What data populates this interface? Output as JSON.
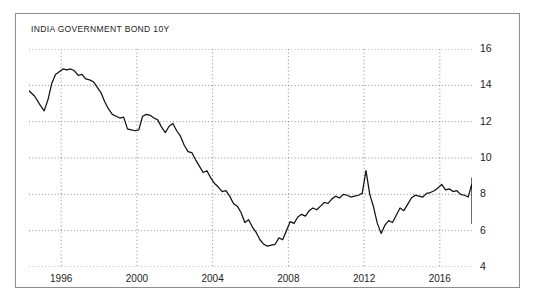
{
  "card": {
    "border_color": "#8d8d8d",
    "background": "#ffffff"
  },
  "chart_data": {
    "type": "line",
    "title": "INDIA GOVERNMENT BOND 10Y",
    "xlabel": "",
    "ylabel": "",
    "series_name": "India Government Bond 10Y Yield",
    "line_color": "#111111",
    "grid": true,
    "grid_style": "dotted",
    "grid_color": "#6b6b6b",
    "legend_position": "none",
    "xlim": [
      1994.3,
      2017.7
    ],
    "ylim": [
      4,
      16
    ],
    "yticks": [
      4,
      6,
      8,
      10,
      12,
      14,
      16
    ],
    "ytick_labels": [
      "4",
      "6",
      "8",
      "10",
      "12",
      "14",
      "16"
    ],
    "xticks": [
      1996,
      2000,
      2004,
      2008,
      2012,
      2016
    ],
    "xtick_labels": [
      "1996",
      "2000",
      "2004",
      "2008",
      "2012",
      "2016"
    ],
    "x": [
      1994.3,
      1994.6,
      1994.9,
      1995.1,
      1995.3,
      1995.5,
      1995.7,
      1995.9,
      1996.1,
      1996.3,
      1996.5,
      1996.7,
      1996.9,
      1997.1,
      1997.3,
      1997.5,
      1997.7,
      1997.9,
      1998.1,
      1998.3,
      1998.5,
      1998.7,
      1998.9,
      1999.1,
      1999.3,
      1999.5,
      1999.7,
      1999.9,
      2000.1,
      2000.3,
      2000.5,
      2000.7,
      2000.9,
      2001.1,
      2001.3,
      2001.5,
      2001.7,
      2001.9,
      2002.1,
      2002.3,
      2002.5,
      2002.7,
      2002.9,
      2003.1,
      2003.3,
      2003.5,
      2003.7,
      2003.9,
      2004.1,
      2004.3,
      2004.5,
      2004.7,
      2004.9,
      2005.1,
      2005.3,
      2005.5,
      2005.7,
      2005.9,
      2006.1,
      2006.3,
      2006.5,
      2006.7,
      2006.9,
      2007.1,
      2007.3,
      2007.5,
      2007.7,
      2007.9,
      2008.1,
      2008.3,
      2008.5,
      2008.7,
      2008.9,
      2009.1,
      2009.3,
      2009.5,
      2009.7,
      2009.9,
      2010.1,
      2010.3,
      2010.5,
      2010.7,
      2010.9,
      2011.1,
      2011.3,
      2011.5,
      2011.7,
      2011.9,
      2012.1,
      2012.3,
      2012.5,
      2012.7,
      2012.9,
      2013.1,
      2013.3,
      2013.5,
      2013.7,
      2013.9,
      2014.1,
      2014.3,
      2014.5,
      2014.7,
      2014.9,
      2015.1,
      2015.3,
      2015.5,
      2015.7,
      2015.9,
      2016.1,
      2016.3,
      2016.5,
      2016.7,
      2016.9,
      2017.1,
      2017.3,
      2017.5
    ],
    "values": [
      13.7,
      13.4,
      12.9,
      12.6,
      13.2,
      14.1,
      14.6,
      14.75,
      14.9,
      14.85,
      14.9,
      14.8,
      14.55,
      14.6,
      14.35,
      14.3,
      14.2,
      13.9,
      13.6,
      13.1,
      12.7,
      12.4,
      12.3,
      12.2,
      12.25,
      11.6,
      11.55,
      11.5,
      11.55,
      12.3,
      12.4,
      12.35,
      12.2,
      12.1,
      11.7,
      11.4,
      11.75,
      11.9,
      11.5,
      11.2,
      10.7,
      10.35,
      10.3,
      9.9,
      9.55,
      9.2,
      9.3,
      8.9,
      8.6,
      8.4,
      8.15,
      8.2,
      7.9,
      7.5,
      7.35,
      7.0,
      6.45,
      6.6,
      6.2,
      5.9,
      5.5,
      5.25,
      5.15,
      5.2,
      5.25,
      5.6,
      5.5,
      6.0,
      6.5,
      6.4,
      6.75,
      6.9,
      6.8,
      7.1,
      7.25,
      7.15,
      7.35,
      7.55,
      7.5,
      7.75,
      7.9,
      7.8,
      8.0,
      7.95,
      7.85,
      7.9,
      7.95,
      8.05,
      9.3,
      8.0,
      7.3,
      6.4,
      5.85,
      6.3,
      6.55,
      6.45,
      6.85,
      7.25,
      7.1,
      7.45,
      7.8,
      7.95,
      7.9,
      7.85,
      8.05,
      8.1,
      8.2,
      8.35,
      8.55,
      8.25,
      8.3,
      8.15,
      8.2,
      8.0,
      7.95,
      7.85
    ],
    "extra_values": [
      8.6,
      8.1,
      8.4,
      8.25,
      8.05,
      7.8,
      7.55,
      7.25,
      7.1,
      7.85,
      8.6,
      8.75,
      8.85,
      8.9,
      8.8,
      8.7,
      8.65,
      8.45,
      8.1,
      7.95,
      7.9,
      7.85,
      7.95,
      7.8,
      7.85,
      7.95,
      7.85,
      7.7,
      7.75,
      7.6,
      7.45,
      7.25,
      7.05,
      6.85,
      6.5,
      6.4,
      6.85,
      6.75,
      6.95,
      6.8
    ],
    "annotations": {
      "peak_1996": 14.9,
      "trough_2004": 5.15,
      "spike_2008": 9.3,
      "crash_2009": 5.85,
      "peak_2013": 8.9,
      "final_value": 6.8
    }
  }
}
